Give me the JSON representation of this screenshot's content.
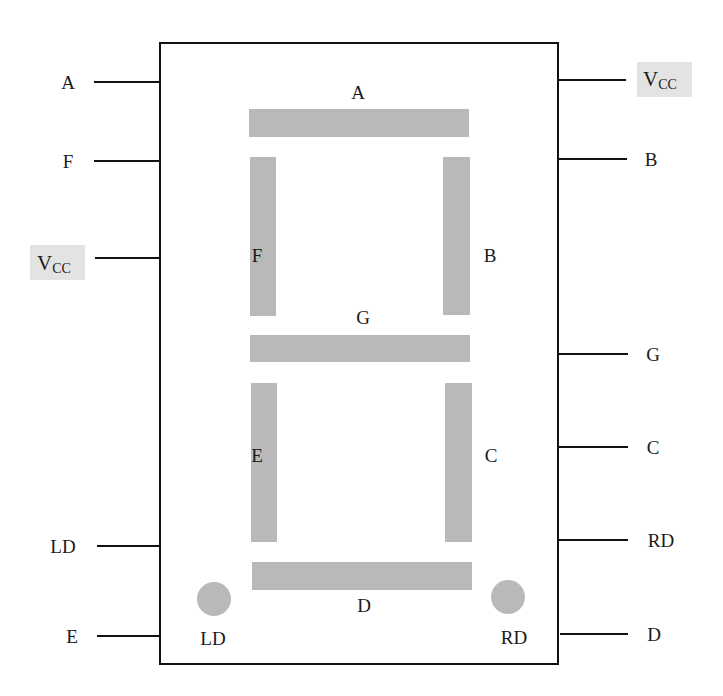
{
  "colors": {
    "segment": "#b9b9b9",
    "line": "#111111",
    "vcc_highlight": "#e3e3e3"
  },
  "segments": {
    "A": "A",
    "B": "B",
    "C": "C",
    "D": "D",
    "E": "E",
    "F": "F",
    "G": "G",
    "LD": "LD",
    "RD": "RD"
  },
  "left_pins": [
    {
      "label": "A"
    },
    {
      "label": "F"
    },
    {
      "label": "V",
      "sub": "CC",
      "highlight": true
    },
    {
      "label": "LD"
    },
    {
      "label": "E"
    }
  ],
  "right_pins": [
    {
      "label": "V",
      "sub": "CC",
      "highlight": true
    },
    {
      "label": "B"
    },
    {
      "label": "G"
    },
    {
      "label": "C"
    },
    {
      "label": "RD"
    },
    {
      "label": "D"
    }
  ]
}
